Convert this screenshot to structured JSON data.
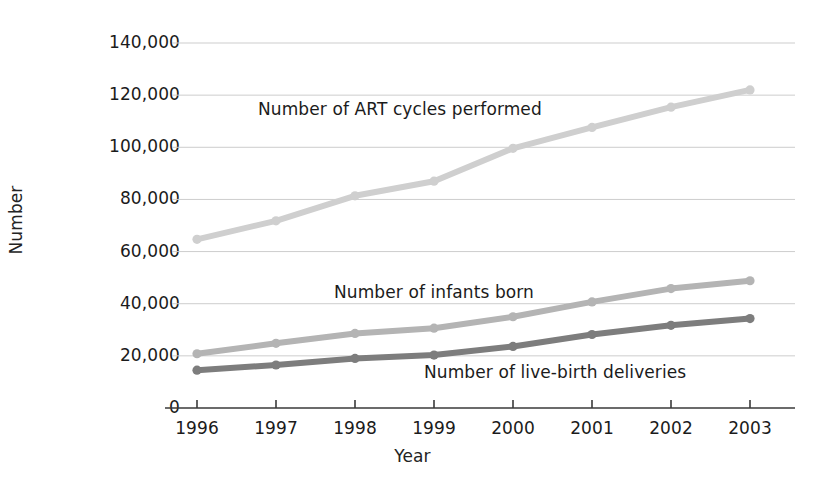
{
  "chart_data": {
    "type": "line",
    "title": "",
    "xlabel": "Year",
    "ylabel": "Number",
    "categories": [
      "1996",
      "1997",
      "1998",
      "1999",
      "2000",
      "2001",
      "2002",
      "2003"
    ],
    "x": [
      1996,
      1997,
      1998,
      1999,
      2000,
      2001,
      2002,
      2003
    ],
    "ylim": [
      0,
      140000
    ],
    "yticks": [
      0,
      20000,
      40000,
      60000,
      80000,
      100000,
      120000,
      140000
    ],
    "ytick_labels": [
      "0",
      "20,000",
      "40,000",
      "60,000",
      "80,000",
      "100,000",
      "120,000",
      "140,000"
    ],
    "grid": true,
    "legend_position": "inline-annotations",
    "series": [
      {
        "name": "Number of ART cycles performed",
        "color": "#cfcfcf",
        "values": [
          64700,
          71800,
          81400,
          87000,
          99600,
          107600,
          115400,
          122000
        ]
      },
      {
        "name": "Number of infants born",
        "color": "#b4b4b4",
        "values": [
          20800,
          24800,
          28600,
          30600,
          35000,
          40700,
          45800,
          48800
        ]
      },
      {
        "name": "Number of live-birth deliveries",
        "color": "#7d7d7d",
        "values": [
          14500,
          16500,
          19000,
          20300,
          23600,
          28200,
          31700,
          34300
        ]
      }
    ],
    "annotations": [
      {
        "text": "Number of ART cycles performed",
        "series": "Number of ART cycles performed"
      },
      {
        "text": "Number of infants born",
        "series": "Number of infants born"
      },
      {
        "text": "Number of live-birth deliveries",
        "series": "Number of live-birth deliveries"
      }
    ]
  },
  "colors": {
    "background": "#ffffff",
    "axis": "#3a3a3a",
    "gridline": "#cdcdcd",
    "text": "#1b1b1b",
    "series_art": "#cfcfcf",
    "series_infants": "#b4b4b4",
    "series_deliveries": "#7d7d7d"
  },
  "axes": {
    "y_title": "Number",
    "x_title": "Year"
  }
}
